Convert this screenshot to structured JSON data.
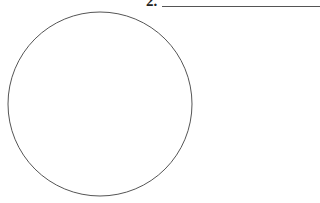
{
  "question": {
    "number_label": "2.",
    "answer_blank": ""
  },
  "figure": {
    "shape": "circle",
    "center_x": 100,
    "center_y": 104,
    "radius": 92,
    "stroke_color": "#555555",
    "fill_color": "#ffffff"
  },
  "colors": {
    "background": "#ffffff",
    "text": "#222222",
    "line": "#555555"
  }
}
